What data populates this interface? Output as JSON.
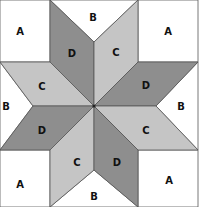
{
  "colors": {
    "A": "#ffffff",
    "B": "#ffffff",
    "C": "#c5c5c5",
    "D": "#8e8e8e",
    "outline": "#555555",
    "label": "#111111"
  },
  "pieces": [
    {
      "id": "a-top-left",
      "label": "A",
      "points": "0,0 50,0 50,62 0,62",
      "label_x": 20,
      "label_y": 35
    },
    {
      "id": "a-top-right",
      "label": "A",
      "points": "138,0 198,0 198,62 138,62",
      "label_x": 168,
      "label_y": 35
    },
    {
      "id": "a-bottom-left",
      "label": "A",
      "points": "0,150 50,150 50,207 0,207",
      "label_x": 20,
      "label_y": 188
    },
    {
      "id": "a-bottom-right",
      "label": "A",
      "points": "138,150 198,150 198,207 138,207",
      "label_x": 169,
      "label_y": 184
    },
    {
      "id": "b-top",
      "label": "B",
      "points": "50,0 138,0 94,42",
      "label_x": 93,
      "label_y": 21
    },
    {
      "id": "b-right",
      "label": "B",
      "points": "198,62 198,150 156,106",
      "label_x": 181,
      "label_y": 110
    },
    {
      "id": "b-bottom",
      "label": "B",
      "points": "50,207 138,207 94,170",
      "label_x": 94,
      "label_y": 200
    },
    {
      "id": "b-left",
      "label": "B",
      "points": "0,62 0,150 33,106",
      "label_x": 6,
      "label_y": 110
    },
    {
      "id": "d-top-left",
      "label": "D",
      "points": "50,0 94,42 94,106 50,62",
      "label_x": 72,
      "label_y": 57
    },
    {
      "id": "c-top-right",
      "label": "C",
      "points": "138,0 138,62 94,106 94,42",
      "label_x": 116,
      "label_y": 56
    },
    {
      "id": "c-left-top",
      "label": "C",
      "points": "0,62 50,62 94,106 33,106",
      "label_x": 42,
      "label_y": 90
    },
    {
      "id": "d-right-top",
      "label": "D",
      "points": "138,62 198,62 156,106 94,106",
      "label_x": 146,
      "label_y": 89
    },
    {
      "id": "d-left-bottom",
      "label": "D",
      "points": "33,106 94,106 50,150 0,150",
      "label_x": 42,
      "label_y": 134
    },
    {
      "id": "c-right-bottom",
      "label": "C",
      "points": "94,106 156,106 198,150 138,150",
      "label_x": 146,
      "label_y": 134
    },
    {
      "id": "c-bottom-left",
      "label": "C",
      "points": "94,106 50,150 50,207 94,170",
      "label_x": 77,
      "label_y": 166
    },
    {
      "id": "d-bottom-right",
      "label": "D",
      "points": "94,106 94,170 138,207 138,150",
      "label_x": 117,
      "label_y": 166
    }
  ],
  "center": {
    "x": 94,
    "y": 106
  }
}
